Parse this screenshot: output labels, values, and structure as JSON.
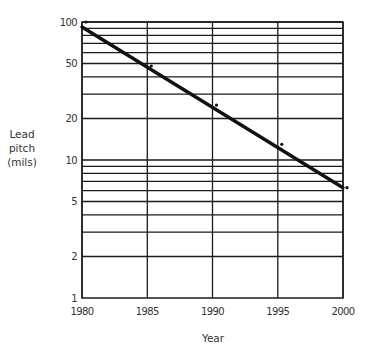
{
  "chart_data": {
    "type": "scatter",
    "title": "",
    "xlabel": "Year",
    "ylabel": [
      "Lead",
      "pitch",
      "(mils)"
    ],
    "y_scale": "log",
    "xlim": [
      1980,
      2000
    ],
    "ylim": [
      1,
      100
    ],
    "grid": true,
    "x_ticks": [
      1980,
      1985,
      1990,
      1995,
      2000
    ],
    "x_tick_labels": [
      "1980",
      "1985",
      "1990",
      "1995",
      "2000"
    ],
    "y_ticks": [
      1,
      2,
      5,
      10,
      20,
      50,
      100
    ],
    "y_tick_labels": [
      "1",
      "2",
      "5",
      "10",
      "20",
      "50",
      "100"
    ],
    "y_gridlines": [
      2,
      3,
      4,
      5,
      6,
      7,
      8,
      9,
      10,
      20,
      30,
      40,
      50,
      60,
      70,
      80,
      90,
      100
    ],
    "series": [
      {
        "name": "Observed lead pitch",
        "kind": "points",
        "x": [
          1980,
          1985,
          1990,
          1995,
          2000
        ],
        "y": [
          100,
          48,
          25,
          13,
          6.3
        ]
      },
      {
        "name": "Trend line",
        "kind": "line",
        "x": [
          1980,
          2000
        ],
        "y": [
          92,
          6.3
        ]
      }
    ],
    "legend": null
  }
}
